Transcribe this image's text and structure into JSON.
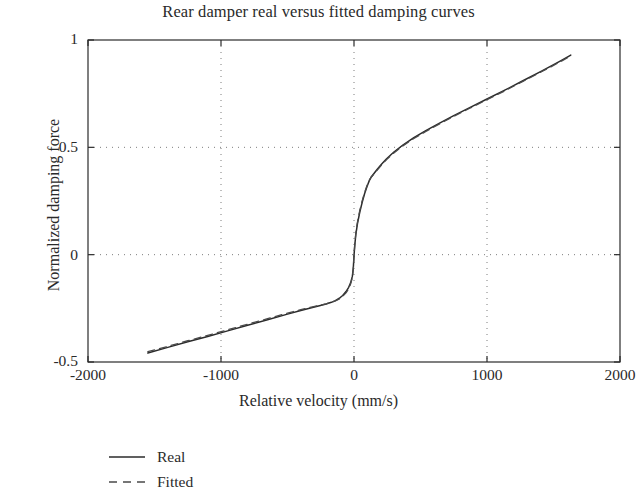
{
  "chart_data": {
    "type": "line",
    "title": "Rear damper real versus fitted damping curves",
    "xlabel": "Relative velocity (mm/s)",
    "ylabel": "Normalized damping force",
    "xlim": [
      -2000,
      2000
    ],
    "ylim": [
      -0.5,
      1
    ],
    "xticks": [
      -2000,
      -1000,
      0,
      1000,
      2000
    ],
    "xticklabels": [
      "-2000",
      "-1000",
      "0",
      "1000",
      "2000"
    ],
    "yticks": [
      -0.5,
      0,
      0.5,
      1
    ],
    "yticklabels": [
      "-0.5",
      "0",
      "0.5",
      "1"
    ],
    "grid": true,
    "grid_style": "dotted",
    "legend_position": "below-left",
    "series": [
      {
        "name": "Real",
        "style": "solid",
        "color": "#2b2b2b",
        "x": [
          -1550,
          -1400,
          -1250,
          -1100,
          -950,
          -800,
          -650,
          -500,
          -400,
          -320,
          -260,
          -210,
          -170,
          -140,
          -110,
          -85,
          -60,
          -40,
          -25,
          -12,
          -5,
          0,
          6,
          14,
          26,
          44,
          62,
          80,
          98,
          115,
          130,
          150,
          175,
          205,
          245,
          300,
          370,
          450,
          540,
          640,
          750,
          870,
          1000,
          1130,
          1270,
          1410,
          1550,
          1630
        ],
        "y": [
          -0.458,
          -0.432,
          -0.406,
          -0.381,
          -0.355,
          -0.329,
          -0.303,
          -0.277,
          -0.26,
          -0.247,
          -0.238,
          -0.23,
          -0.222,
          -0.214,
          -0.203,
          -0.19,
          -0.172,
          -0.152,
          -0.13,
          -0.1,
          -0.06,
          -0.005,
          0.045,
          0.095,
          0.145,
          0.2,
          0.245,
          0.285,
          0.318,
          0.345,
          0.362,
          0.378,
          0.398,
          0.42,
          0.447,
          0.478,
          0.512,
          0.545,
          0.578,
          0.612,
          0.648,
          0.685,
          0.725,
          0.765,
          0.81,
          0.855,
          0.902,
          0.93
        ]
      },
      {
        "name": "Fitted",
        "style": "dashed",
        "color": "#4a4a4a",
        "x": [
          -1550,
          -1400,
          -1250,
          -1100,
          -950,
          -800,
          -650,
          -500,
          -400,
          -320,
          -260,
          -210,
          -170,
          -140,
          -110,
          -85,
          -60,
          -40,
          -25,
          -12,
          -5,
          0,
          6,
          14,
          26,
          44,
          62,
          80,
          98,
          115,
          130,
          150,
          175,
          205,
          245,
          300,
          370,
          450,
          540,
          640,
          750,
          870,
          1000,
          1130,
          1270,
          1410,
          1550,
          1630
        ],
        "y": [
          -0.452,
          -0.427,
          -0.401,
          -0.376,
          -0.35,
          -0.324,
          -0.298,
          -0.272,
          -0.256,
          -0.244,
          -0.236,
          -0.229,
          -0.222,
          -0.215,
          -0.206,
          -0.194,
          -0.178,
          -0.159,
          -0.136,
          -0.105,
          -0.062,
          -0.003,
          0.05,
          0.102,
          0.152,
          0.207,
          0.252,
          0.29,
          0.322,
          0.347,
          0.362,
          0.376,
          0.394,
          0.416,
          0.443,
          0.474,
          0.508,
          0.541,
          0.574,
          0.608,
          0.644,
          0.682,
          0.722,
          0.762,
          0.807,
          0.852,
          0.898,
          0.926
        ]
      }
    ]
  },
  "legend": {
    "items": [
      {
        "label": "Real",
        "style": "solid"
      },
      {
        "label": "Fitted",
        "style": "dashed"
      }
    ]
  },
  "colors": {
    "axis": "#2b2b2b",
    "grid": "#7d7d7d",
    "background": "#ffffff"
  }
}
